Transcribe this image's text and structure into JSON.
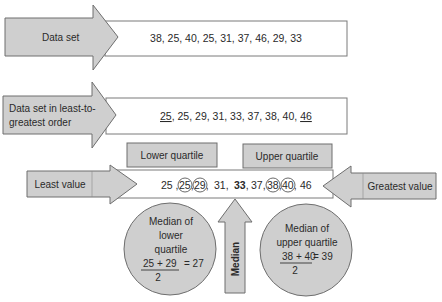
{
  "data_set": {
    "label": "Data set",
    "values_text": "38, 25, 40, 25, 31, 37, 46, 29, 33",
    "values": [
      38,
      25,
      40,
      25,
      31,
      37,
      46,
      29,
      33
    ]
  },
  "sorted_set": {
    "label_line1": "Data set in least-to-",
    "label_line2": "greatest order",
    "first_underlined": "25",
    "middle_text": ", 25, 29, 31, 33, 37, 38, 40, ",
    "last_underlined": "46",
    "values": [
      25,
      25,
      29,
      31,
      33,
      37,
      38,
      40,
      46
    ]
  },
  "quartile_labels": {
    "lower": "Lower quartile",
    "upper": "Upper quartile"
  },
  "extremes": {
    "least_label": "Least value",
    "greatest_label": "Greatest value"
  },
  "number_line": {
    "items": [
      {
        "text": "25",
        "circled": false,
        "bold": false,
        "sep": " ,"
      },
      {
        "text": "25",
        "circled": true,
        "bold": false,
        "sep": ","
      },
      {
        "text": "29",
        "circled": true,
        "bold": false,
        "sep": ", "
      },
      {
        "text": "31",
        "circled": false,
        "bold": false,
        "sep": ", "
      },
      {
        "text": "33",
        "circled": false,
        "bold": true,
        "sep": ", "
      },
      {
        "text": "37",
        "circled": false,
        "bold": false,
        "sep": ","
      },
      {
        "text": "38",
        "circled": true,
        "bold": false,
        "sep": ","
      },
      {
        "text": "40",
        "circled": true,
        "bold": false,
        "sep": ", "
      },
      {
        "text": "46",
        "circled": false,
        "bold": false,
        "sep": ""
      }
    ]
  },
  "median": {
    "label": "Median",
    "value": 33
  },
  "lower_median": {
    "line1": "Median of",
    "line2": "lower",
    "line3": "quartile",
    "numerator": "25 + 29",
    "result": "= 27",
    "denominator": "2"
  },
  "upper_median": {
    "line1": "Median of",
    "line2": "upper quartile",
    "numerator": "38 + 40",
    "result": "= 39",
    "denominator": "2"
  },
  "colors": {
    "shape_fill": "#cfcfcf",
    "shape_stroke": "#6e6e6e",
    "text": "#2a2a2a",
    "background": "#ffffff"
  }
}
